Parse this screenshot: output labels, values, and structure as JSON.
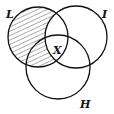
{
  "diagram": {
    "type": "venn",
    "sets": [
      {
        "name": "L",
        "cx": 38,
        "cy": 37,
        "r": 30
      },
      {
        "name": "I",
        "cx": 76,
        "cy": 37,
        "r": 31
      },
      {
        "name": "H",
        "cx": 58,
        "cy": 67,
        "r": 32
      }
    ],
    "shaded_region": "L minus I",
    "center_label": "X",
    "line_color": "#111111"
  }
}
